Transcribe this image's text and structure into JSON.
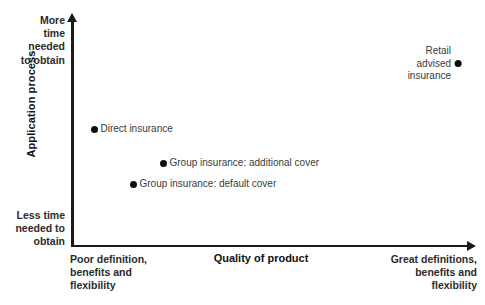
{
  "chart_data": {
    "type": "scatter",
    "title": "",
    "xlabel": "Quality of product",
    "ylabel": "Application process",
    "grid": false,
    "legend": "none",
    "axis_captions": {
      "y_top": "More\ntime\nneeded\nto obtain",
      "y_bottom": "Less time\nneeded to\nobtain",
      "x_left": "Poor definition,\nbenefits and\nflexibility",
      "x_right": "Great definitions,\nbenefits and\nflexibility"
    },
    "xlim": [
      0,
      100
    ],
    "ylim": [
      0,
      100
    ],
    "points": [
      {
        "label": "Direct insurance",
        "x": 6,
        "y": 53,
        "label_position": "right",
        "px": 94,
        "py": 127
      },
      {
        "label": "Group insurance: additional cover",
        "x": 23,
        "y": 38,
        "label_position": "right",
        "px": 163,
        "py": 161
      },
      {
        "label": "Group insurance: default cover",
        "x": 15,
        "y": 28,
        "label_position": "right",
        "px": 133,
        "py": 182
      },
      {
        "label": "Retail advised\ninsurance",
        "x": 97,
        "y": 87,
        "label_position": "left",
        "px": 458,
        "py": 49
      }
    ],
    "colors": {
      "marker": "#0d0d0d",
      "axis": "#1a1a1a",
      "label_text": "#3a3a3a",
      "title_text": "#111111",
      "background": "#ffffff"
    }
  }
}
